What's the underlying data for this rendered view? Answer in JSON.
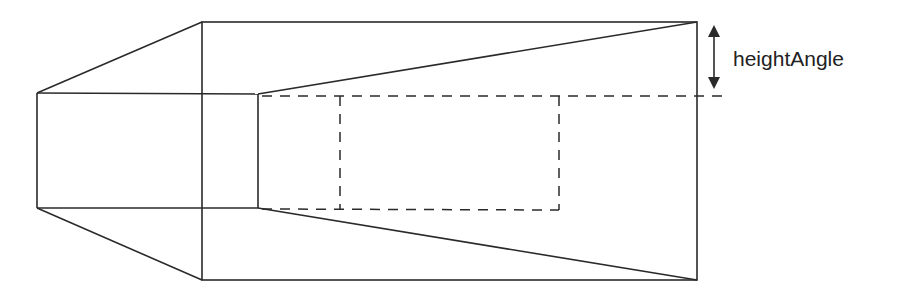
{
  "diagram": {
    "label": "heightAngle",
    "stroke_color": "#2a2a2a",
    "background": "#ffffff"
  }
}
